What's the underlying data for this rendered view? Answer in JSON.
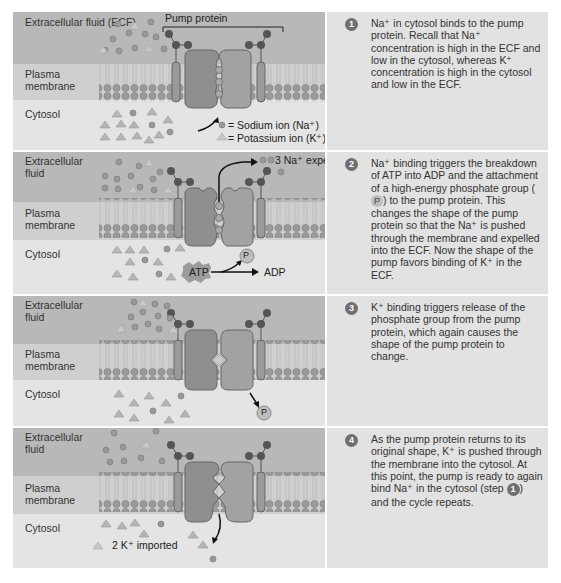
{
  "figure": {
    "colors": {
      "ecf_band": "#b8b8b8",
      "membrane_band": "#cfcfcf",
      "cytosol_band": "#e4e4e4",
      "text_panel": "#e2e2e2",
      "pump_protein": "#8f8f8f",
      "step_badge": "#6f6f6f"
    },
    "legend": {
      "sodium": "= Sodium ion (Na⁺)",
      "potassium": "= Potassium ion (K⁺)"
    },
    "pump_label": "Pump protein",
    "steps": [
      {
        "number": "1",
        "labels": {
          "ecf": "Extracellular fluid (ECF)",
          "membrane": "Plasma membrane",
          "cytosol": "Cytosol"
        },
        "description": "Na⁺ in cytosol binds to the pump protein. Recall that Na⁺ concentration is high in the ECF and low in the cytosol, whereas K⁺ concentration is high in the cytosol and low in the ECF."
      },
      {
        "number": "2",
        "labels": {
          "ecf": "Extracellular fluid",
          "membrane": "Plasma membrane",
          "cytosol": "Cytosol"
        },
        "annotations": {
          "expelled": "3 Na⁺ expelled",
          "atp": "ATP",
          "adp": "ADP",
          "phosphate": "P"
        },
        "description_parts": [
          "Na⁺ binding triggers the breakdown of ATP into ADP and the attachment of a high-energy phosphate group (",
          "P",
          ") to the pump protein. This changes the shape of the pump protein so that the Na⁺ is pushed through the membrane and expelled into the ECF. Now the shape of the pump favors binding of K⁺ in the ECF."
        ]
      },
      {
        "number": "3",
        "labels": {
          "ecf": "Extracellular fluid",
          "membrane": "Plasma membrane",
          "cytosol": "Cytosol"
        },
        "annotations": {
          "phosphate": "P"
        },
        "description": "K⁺ binding triggers release of the phosphate group from the pump protein, which again causes the shape of the pump protein to change."
      },
      {
        "number": "4",
        "labels": {
          "ecf": "Extracellular fluid",
          "membrane": "Plasma membrane",
          "cytosol": "Cytosol"
        },
        "annotations": {
          "imported": "2 K⁺ imported"
        },
        "description_parts": [
          "As the pump protein returns to its original shape, K⁺ is pushed through the membrane into the cytosol. At this point, the pump is ready to again bind Na⁺ in the cytosol (step ",
          "1",
          ") and the cycle repeats."
        ]
      }
    ]
  }
}
